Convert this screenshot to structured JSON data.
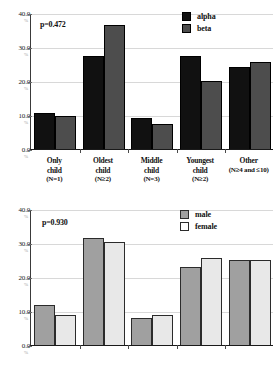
{
  "figure": {
    "panels": [
      {
        "id": "top",
        "annotation": "p=0.472",
        "legend": [
          {
            "key": "alpha",
            "label": "alpha",
            "color": "#111111"
          },
          {
            "key": "beta",
            "label": "beta",
            "color": "#4d4d4d"
          }
        ]
      },
      {
        "id": "bottom",
        "annotation": "p=0.930",
        "legend": [
          {
            "key": "male",
            "label": "male",
            "color": "#a0a0a0"
          },
          {
            "key": "female",
            "label": "female",
            "color": "#ffffff"
          }
        ]
      }
    ],
    "y_ticks": [
      "0.0",
      "10.0",
      "20.0",
      "30.0",
      "40.0"
    ],
    "y_tick_sub": [
      "%",
      "%",
      "%",
      "%",
      "%"
    ],
    "categories": [
      {
        "line1": "Only",
        "line2": "child",
        "n": "(N=1)"
      },
      {
        "line1": "Oldest",
        "line2": "child",
        "n": "(N≥2)"
      },
      {
        "line1": "Middle",
        "line2": "child",
        "n": "(N=3)"
      },
      {
        "line1": "Youngest",
        "line2": "child",
        "n": "(N≥2)"
      },
      {
        "line1": "Other",
        "line2": "",
        "n": "(N≥4 and ≤10)"
      }
    ]
  },
  "chart_data": [
    {
      "type": "bar",
      "title": "",
      "xlabel": "",
      "ylabel": "%",
      "ylim": [
        0,
        40
      ],
      "yticks": [
        0,
        10,
        20,
        30,
        40
      ],
      "grid": true,
      "legend_position": "top-right",
      "annotations": [
        "p=0.472"
      ],
      "categories": [
        "Only child (N=1)",
        "Oldest child (N≥2)",
        "Middle child (N=3)",
        "Youngest child (N≥2)",
        "Other (N≥4 and ≤10)"
      ],
      "series": [
        {
          "name": "alpha",
          "color": "#111111",
          "values": [
            10.5,
            27.5,
            9.2,
            27.5,
            24.2
          ]
        },
        {
          "name": "beta",
          "color": "#4d4d4d",
          "values": [
            9.8,
            36.5,
            7.3,
            20.0,
            25.5
          ]
        }
      ]
    },
    {
      "type": "bar",
      "title": "",
      "xlabel": "",
      "ylabel": "%",
      "ylim": [
        0,
        40
      ],
      "yticks": [
        0,
        10,
        20,
        30,
        40
      ],
      "grid": true,
      "legend_position": "top-right",
      "annotations": [
        "p=0.930"
      ],
      "categories": [
        "Only child (N=1)",
        "Oldest child (N≥2)",
        "Middle child (N=3)",
        "Youngest child (N≥2)",
        "Other (N≥4 and ≤10)"
      ],
      "series": [
        {
          "name": "male",
          "color": "#a0a0a0",
          "values": [
            11.8,
            31.5,
            7.8,
            23.0,
            25.0
          ]
        },
        {
          "name": "female",
          "color": "#ffffff",
          "values": [
            8.8,
            30.3,
            8.7,
            25.7,
            25.0
          ]
        }
      ]
    }
  ]
}
